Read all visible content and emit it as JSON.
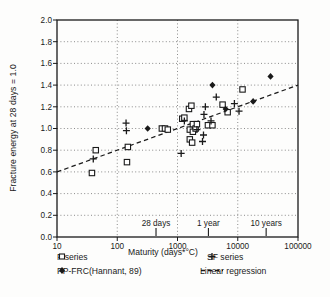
{
  "figure": {
    "background": "#fdfdfc",
    "ink_color": "#1a1a1a",
    "grid_color": "#6e6e6e"
  },
  "chart_data": {
    "type": "scatter",
    "title": "",
    "xlabel": "Maturity (days*°C)",
    "ylabel": "Fracture energy at 28 days = 1.0",
    "x_scale": "log",
    "xlim": [
      10,
      100000
    ],
    "ylim": [
      0.0,
      2.0
    ],
    "x_ticks": [
      10,
      100,
      1000,
      10000,
      100000
    ],
    "x_tick_labels": [
      "10",
      "100",
      "1000",
      "10000",
      "100000"
    ],
    "y_ticks": [
      0.0,
      0.2,
      0.4,
      0.6,
      0.8,
      1.0,
      1.2,
      1.4,
      1.6,
      1.8,
      2.0
    ],
    "y_tick_labels": [
      "0.0",
      "0.2",
      "0.4",
      "0.6",
      "0.8",
      "1.0",
      "1.2",
      "1.4",
      "1.6",
      "1.8",
      "2.0"
    ],
    "grid": "dotted",
    "legend_position": "bottom",
    "series": [
      {
        "name": "F series",
        "marker": "open-square",
        "points": [
          [
            38,
            0.59
          ],
          [
            44,
            0.8
          ],
          [
            145,
            0.69
          ],
          [
            150,
            0.83
          ],
          [
            550,
            1.0
          ],
          [
            620,
            1.0
          ],
          [
            690,
            0.99
          ],
          [
            1200,
            1.09
          ],
          [
            1300,
            1.1
          ],
          [
            1550,
            1.18
          ],
          [
            1600,
            0.99
          ],
          [
            1600,
            0.9
          ],
          [
            1700,
            1.21
          ],
          [
            1750,
            0.87
          ],
          [
            1800,
            1.04
          ],
          [
            1800,
            0.97
          ],
          [
            2000,
            1.0
          ],
          [
            2100,
            1.04
          ],
          [
            3200,
            1.03
          ],
          [
            3800,
            1.03
          ],
          [
            5600,
            1.22
          ],
          [
            6800,
            1.15
          ],
          [
            12000,
            1.36
          ]
        ]
      },
      {
        "name": "SF series",
        "marker": "plus",
        "points": [
          [
            40,
            0.72
          ],
          [
            140,
            1.05
          ],
          [
            142,
            0.98
          ],
          [
            1150,
            0.77
          ],
          [
            1300,
            1.07
          ],
          [
            2100,
            0.99
          ],
          [
            2600,
            0.88
          ],
          [
            2700,
            0.94
          ],
          [
            2750,
            1.13
          ],
          [
            2900,
            1.2
          ],
          [
            3600,
            1.07
          ],
          [
            4400,
            1.29
          ],
          [
            8800,
            1.23
          ],
          [
            10500,
            1.16
          ]
        ]
      },
      {
        "name": "PP-FRC(Hannant, 89)",
        "marker": "filled-diamond",
        "points": [
          [
            320,
            1.0
          ],
          [
            3800,
            1.4
          ],
          [
            6300,
            1.18
          ],
          [
            18000,
            1.25
          ],
          [
            35000,
            1.48
          ]
        ]
      },
      {
        "name": "Linear regression",
        "marker": "dashed-line",
        "points": [
          [
            10,
            0.6
          ],
          [
            100000,
            1.4
          ]
        ]
      }
    ],
    "annotations": [
      {
        "label": "28 days",
        "x": 440
      },
      {
        "label": "1 year",
        "x": 3260
      },
      {
        "label": "10 years",
        "x": 29600
      }
    ]
  }
}
